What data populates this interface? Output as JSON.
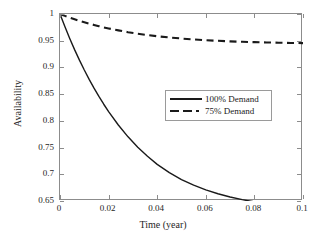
{
  "chart_data": {
    "type": "line",
    "title": "",
    "xlabel": "Time (year)",
    "ylabel": "Availability",
    "xlim": [
      0,
      0.1
    ],
    "ylim": [
      0.65,
      1
    ],
    "xticks": [
      "0",
      "0.02",
      "0.04",
      "0.06",
      "0.08",
      "0.1"
    ],
    "xtick_values": [
      0,
      0.02,
      0.04,
      0.06,
      0.08,
      0.1
    ],
    "yticks": [
      "0.65",
      "0.7",
      "0.75",
      "0.8",
      "0.85",
      "0.9",
      "0.95",
      "1"
    ],
    "ytick_values": [
      0.65,
      0.7,
      0.75,
      0.8,
      0.85,
      0.9,
      0.95,
      1
    ],
    "grid": false,
    "legend_position": "center-right",
    "line_color": "#1a1a1a",
    "series": [
      {
        "name": "100% Demand",
        "style": "solid",
        "x": [
          0,
          0.002,
          0.004,
          0.006,
          0.008,
          0.01,
          0.012,
          0.014,
          0.016,
          0.018,
          0.02,
          0.024,
          0.028,
          0.032,
          0.036,
          0.04,
          0.045,
          0.05,
          0.055,
          0.06,
          0.065,
          0.07,
          0.075,
          0.08,
          0.085,
          0.09,
          0.095,
          0.1
        ],
        "values": [
          1.0,
          0.9764,
          0.9542,
          0.9333,
          0.9136,
          0.8951,
          0.8776,
          0.8612,
          0.8457,
          0.8311,
          0.8173,
          0.7922,
          0.7701,
          0.7507,
          0.7336,
          0.7186,
          0.7031,
          0.6902,
          0.6796,
          0.6708,
          0.6635,
          0.6575,
          0.6525,
          0.6484,
          0.645,
          0.6422,
          0.6399,
          0.638
        ]
      },
      {
        "name": "75% Demand",
        "style": "dashed",
        "x": [
          0,
          0.002,
          0.004,
          0.006,
          0.008,
          0.01,
          0.012,
          0.014,
          0.016,
          0.018,
          0.02,
          0.024,
          0.028,
          0.032,
          0.036,
          0.04,
          0.045,
          0.05,
          0.055,
          0.06,
          0.065,
          0.07,
          0.075,
          0.08,
          0.085,
          0.09,
          0.095,
          0.1
        ],
        "values": [
          1.0,
          0.9965,
          0.9932,
          0.9901,
          0.9872,
          0.9845,
          0.9819,
          0.9795,
          0.9772,
          0.975,
          0.973,
          0.9693,
          0.966,
          0.9632,
          0.9606,
          0.9584,
          0.956,
          0.9541,
          0.9524,
          0.951,
          0.9498,
          0.9488,
          0.948,
          0.9473,
          0.9467,
          0.9462,
          0.9458,
          0.9455
        ]
      }
    ]
  },
  "legend": {
    "items": [
      {
        "label": "100% Demand",
        "style": "solid"
      },
      {
        "label": "75% Demand",
        "style": "dashed"
      }
    ]
  }
}
